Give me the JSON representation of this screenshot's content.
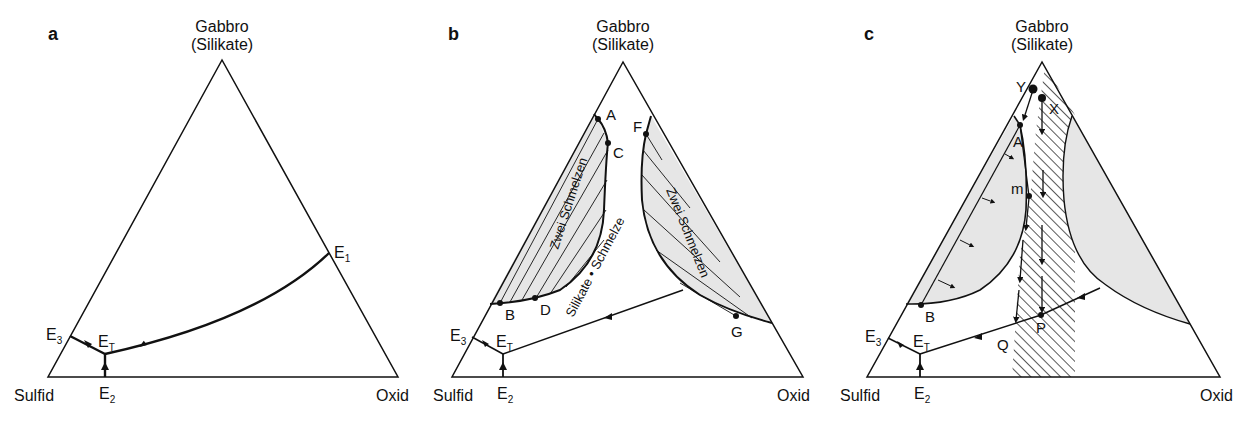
{
  "figure": {
    "panels": [
      {
        "id": "a",
        "label": "a",
        "apex_label_line1": "Gabbro",
        "apex_label_line2": "(Silikate)",
        "left_label": "Sulfid",
        "right_label": "Oxid",
        "points": {
          "E1": "E",
          "E1_sub": "1",
          "E2": "E",
          "E2_sub": "2",
          "E3": "E",
          "E3_sub": "3",
          "ET": "E",
          "ET_sub": "T"
        }
      },
      {
        "id": "b",
        "label": "b",
        "apex_label_line1": "Gabbro",
        "apex_label_line2": "(Silikate)",
        "left_label": "Sulfid",
        "right_label": "Oxid",
        "points": {
          "A": "A",
          "B": "B",
          "C": "C",
          "D": "D",
          "F": "F",
          "G": "G",
          "E2": "E",
          "E2_sub": "2",
          "E3": "E",
          "E3_sub": "3",
          "ET": "E",
          "ET_sub": "T"
        },
        "region_left": "Zwei Schmelzen",
        "region_right": "Zwei Schmelzen",
        "region_center": "Silikate • Schmelze"
      },
      {
        "id": "c",
        "label": "c",
        "apex_label_line1": "Gabbro",
        "apex_label_line2": "(Silikate)",
        "left_label": "Sulfid",
        "right_label": "Oxid",
        "points": {
          "Y": "Y",
          "X": "X",
          "A": "A",
          "m": "m",
          "B": "B",
          "P": "P",
          "Q": "Q",
          "E2": "E",
          "E2_sub": "2",
          "E3": "E",
          "E3_sub": "3",
          "ET": "E",
          "ET_sub": "T"
        }
      }
    ],
    "colors": {
      "line": "#111111",
      "fill_two_liquid": "#e6e6e6",
      "background": "#ffffff"
    }
  }
}
